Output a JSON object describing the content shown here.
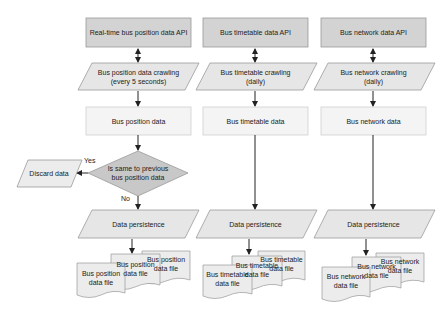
{
  "columns": [
    {
      "api": "Real-time bus position data API",
      "crawl": "Bus position data crawling\n(every 5 seconds)",
      "data": "Bus position data",
      "persist": "Data persistence",
      "files": [
        "Bus position data file",
        "Bus position data file",
        "Bus position data file"
      ]
    },
    {
      "api": "Bus timetable data API",
      "crawl": "Bus timetable crawling\n(daily)",
      "data": "Bus timetable data",
      "persist": "Data persistence",
      "files": [
        "Bus timetable data file",
        "Bus timetable data file",
        "Bus timetable data file"
      ]
    },
    {
      "api": "Bus network data API",
      "crawl": "Bus network crawling\n(daily)",
      "data": "Bus network data",
      "persist": "Data persistence",
      "files": [
        "Bus network data file",
        "Bus network data file",
        "Bus network data file"
      ]
    }
  ],
  "decision": {
    "question": "Is same to previous bus position data",
    "yes_label": "Yes",
    "no_label": "No",
    "discard": "Discard data"
  },
  "colors": {
    "api_fill": "#d3d3d3",
    "crawl_fill": "#e6e6e6",
    "data_fill": "#f4f4f4",
    "decision_fill": "#c8c8c8",
    "stroke": "#9a9a9a",
    "arrow": "#222222"
  }
}
